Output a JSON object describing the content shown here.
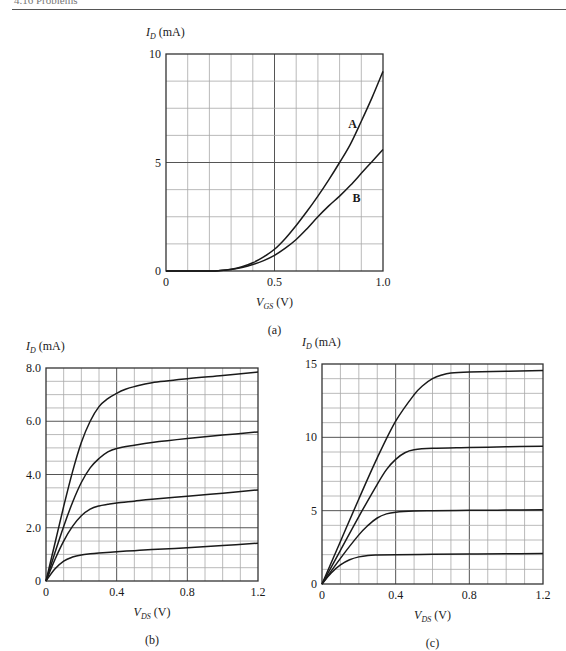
{
  "header": {
    "text": "4.16 Problems"
  },
  "chart_data": [
    {
      "id": "a",
      "type": "line",
      "caption": "(a)",
      "xlabel": "V_GS (V)",
      "xlabel_main": "V",
      "xlabel_sub": "GS",
      "xlabel_unit": "(V)",
      "ylabel": "I_D (mA)",
      "ylabel_main": "I",
      "ylabel_sub": "D",
      "ylabel_unit": "(mA)",
      "xlim": [
        0,
        1.0
      ],
      "ylim": [
        0,
        10
      ],
      "x_ticks": [
        0,
        0.5,
        1.0
      ],
      "x_tick_labels": [
        "0",
        "0.5",
        "1.0"
      ],
      "y_ticks": [
        0,
        5,
        10
      ],
      "y_tick_labels": [
        "0",
        "5",
        "10"
      ],
      "x_grid_divisions": 10,
      "y_grid_divisions": 8,
      "grid": true,
      "x_major_every": 5,
      "y_major_every": 4,
      "plot_box": {
        "x0": 166,
        "y0": 54,
        "x1": 383,
        "y1": 271
      },
      "series": [
        {
          "name": "A",
          "label_pos": [
            0.84,
            6.6
          ],
          "x": [
            0,
            0.2,
            0.25,
            0.3,
            0.35,
            0.4,
            0.45,
            0.5,
            0.55,
            0.6,
            0.65,
            0.7,
            0.75,
            0.8,
            0.85,
            0.9,
            0.95,
            1.0
          ],
          "y": [
            0,
            0,
            0.02,
            0.08,
            0.2,
            0.38,
            0.65,
            1.0,
            1.5,
            2.1,
            2.75,
            3.45,
            4.2,
            5.0,
            5.85,
            6.9,
            8.0,
            9.2
          ]
        },
        {
          "name": "B",
          "label_pos": [
            0.86,
            3.2
          ],
          "x": [
            0,
            0.2,
            0.25,
            0.3,
            0.35,
            0.4,
            0.45,
            0.5,
            0.55,
            0.6,
            0.65,
            0.7,
            0.75,
            0.8,
            0.85,
            0.9,
            0.95,
            1.0
          ],
          "y": [
            0,
            0,
            0.02,
            0.07,
            0.16,
            0.3,
            0.48,
            0.72,
            1.05,
            1.45,
            1.95,
            2.5,
            3.0,
            3.45,
            3.95,
            4.5,
            5.05,
            5.6
          ]
        }
      ]
    },
    {
      "id": "b",
      "type": "line",
      "caption": "(b)",
      "xlabel": "V_DS (V)",
      "xlabel_main": "V",
      "xlabel_sub": "DS",
      "xlabel_unit": "(V)",
      "ylabel": "I_D (mA)",
      "ylabel_main": "I",
      "ylabel_sub": "D",
      "ylabel_unit": "(mA)",
      "xlim": [
        0,
        1.2
      ],
      "ylim": [
        0,
        8.0
      ],
      "x_ticks": [
        0,
        0.4,
        0.8,
        1.2
      ],
      "x_tick_labels": [
        "0",
        "0.4",
        "0.8",
        "1.2"
      ],
      "y_ticks": [
        0,
        2.0,
        4.0,
        6.0,
        8.0
      ],
      "y_tick_labels": [
        "0",
        "2.0",
        "4.0",
        "6.0",
        "8.0"
      ],
      "x_grid_divisions": 12,
      "y_grid_divisions": 16,
      "grid": true,
      "x_major_every": 4,
      "y_major_every": 4,
      "plot_box": {
        "x0": 46,
        "y0": 368,
        "x1": 258,
        "y1": 581
      },
      "series": [
        {
          "name": "curve-1",
          "x": [
            0,
            0.05,
            0.1,
            0.15,
            0.2,
            0.25,
            0.3,
            0.35,
            0.4,
            0.45,
            0.5,
            0.6,
            0.8,
            1.0,
            1.2
          ],
          "y": [
            0,
            1.4,
            2.8,
            4.1,
            5.2,
            6.0,
            6.55,
            6.85,
            7.05,
            7.2,
            7.3,
            7.45,
            7.6,
            7.72,
            7.85
          ]
        },
        {
          "name": "curve-2",
          "x": [
            0,
            0.05,
            0.1,
            0.15,
            0.2,
            0.25,
            0.3,
            0.35,
            0.4,
            0.5,
            0.6,
            0.8,
            1.0,
            1.2
          ],
          "y": [
            0,
            1.05,
            2.05,
            2.95,
            3.7,
            4.25,
            4.6,
            4.85,
            4.98,
            5.1,
            5.2,
            5.35,
            5.48,
            5.6
          ]
        },
        {
          "name": "curve-3",
          "x": [
            0,
            0.05,
            0.1,
            0.15,
            0.2,
            0.25,
            0.3,
            0.35,
            0.4,
            0.5,
            0.6,
            0.8,
            1.0,
            1.2
          ],
          "y": [
            0,
            0.8,
            1.5,
            2.05,
            2.45,
            2.7,
            2.82,
            2.88,
            2.93,
            3.0,
            3.07,
            3.18,
            3.3,
            3.42
          ]
        },
        {
          "name": "curve-4",
          "x": [
            0,
            0.05,
            0.1,
            0.15,
            0.2,
            0.25,
            0.3,
            0.4,
            0.5,
            0.6,
            0.8,
            1.0,
            1.2
          ],
          "y": [
            0,
            0.45,
            0.75,
            0.9,
            0.98,
            1.02,
            1.05,
            1.1,
            1.14,
            1.18,
            1.25,
            1.33,
            1.42
          ]
        }
      ]
    },
    {
      "id": "c",
      "type": "line",
      "caption": "(c)",
      "xlabel": "V_DS (V)",
      "xlabel_main": "V",
      "xlabel_sub": "DS",
      "xlabel_unit": "(V)",
      "ylabel": "I_D (mA)",
      "ylabel_main": "I",
      "ylabel_sub": "D",
      "ylabel_unit": "(mA)",
      "xlim": [
        0,
        1.2
      ],
      "ylim": [
        0,
        15
      ],
      "x_ticks": [
        0,
        0.4,
        0.8,
        1.2
      ],
      "x_tick_labels": [
        "0",
        "0.4",
        "0.8",
        "1.2"
      ],
      "y_ticks": [
        0,
        5,
        10,
        15
      ],
      "y_tick_labels": [
        "0",
        "5",
        "10",
        "15"
      ],
      "x_grid_divisions": 12,
      "y_grid_divisions": 15,
      "grid": true,
      "x_major_every": 4,
      "y_major_every": 5,
      "plot_box": {
        "x0": 322,
        "y0": 364,
        "x1": 543,
        "y1": 584
      },
      "series": [
        {
          "name": "curve-1",
          "x": [
            0,
            0.1,
            0.2,
            0.3,
            0.4,
            0.5,
            0.55,
            0.6,
            0.65,
            0.7,
            0.8,
            1.0,
            1.2
          ],
          "y": [
            0,
            2.9,
            5.8,
            8.6,
            11.1,
            12.9,
            13.55,
            14.0,
            14.25,
            14.38,
            14.45,
            14.5,
            14.55
          ]
        },
        {
          "name": "curve-2",
          "x": [
            0,
            0.1,
            0.2,
            0.3,
            0.35,
            0.4,
            0.45,
            0.5,
            0.6,
            0.8,
            1.0,
            1.2
          ],
          "y": [
            0,
            2.3,
            4.6,
            6.8,
            7.8,
            8.5,
            8.95,
            9.15,
            9.25,
            9.3,
            9.35,
            9.4
          ]
        },
        {
          "name": "curve-3",
          "x": [
            0,
            0.1,
            0.2,
            0.25,
            0.3,
            0.35,
            0.4,
            0.5,
            0.6,
            0.8,
            1.0,
            1.2
          ],
          "y": [
            0,
            1.75,
            3.35,
            4.0,
            4.5,
            4.78,
            4.9,
            4.98,
            5.0,
            5.02,
            5.04,
            5.06
          ]
        },
        {
          "name": "curve-4",
          "x": [
            0,
            0.05,
            0.1,
            0.15,
            0.2,
            0.25,
            0.3,
            0.4,
            0.6,
            0.8,
            1.0,
            1.2
          ],
          "y": [
            0,
            0.75,
            1.3,
            1.65,
            1.85,
            1.95,
            1.98,
            2.0,
            2.02,
            2.04,
            2.06,
            2.08
          ]
        }
      ]
    }
  ]
}
